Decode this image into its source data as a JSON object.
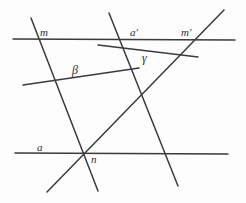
{
  "figure": {
    "width": 246,
    "height": 203,
    "background_color": "#fdfdfd",
    "stroke_color": "#3a3a3f",
    "label_color": "#2e2e33"
  },
  "lines": [
    {
      "name": "horizontal-line-upper",
      "role": "upper horizontal transversal",
      "x1": 13,
      "y1": 39,
      "x2": 235,
      "y2": 40
    },
    {
      "name": "horizontal-line-a",
      "role": "lower horizontal line labeled a",
      "x1": 15,
      "y1": 153,
      "x2": 228,
      "y2": 154
    },
    {
      "name": "line-m",
      "role": "steep descending line labeled m",
      "x1": 31,
      "y1": 18,
      "x2": 98,
      "y2": 191
    },
    {
      "name": "line-a-prime",
      "role": "steep descending line labeled a-prime",
      "x1": 109,
      "y1": 13,
      "x2": 178,
      "y2": 186
    },
    {
      "name": "line-m-prime",
      "role": "ascending line labeled m-prime",
      "x1": 47,
      "y1": 192,
      "x2": 224,
      "y2": 10
    },
    {
      "name": "line-beta",
      "role": "shallow ascending segment labeled beta",
      "x1": 23,
      "y1": 85,
      "x2": 139,
      "y2": 68
    },
    {
      "name": "line-gamma",
      "role": "shallow descending segment labeled gamma",
      "x1": 98,
      "y1": 45,
      "x2": 198,
      "y2": 57
    }
  ],
  "labels": [
    {
      "name": "label-m",
      "text": "m",
      "x": 40,
      "y": 27,
      "style": "italic"
    },
    {
      "name": "label-a-prime",
      "text": "a′",
      "x": 130,
      "y": 27,
      "style": "italic"
    },
    {
      "name": "label-m-prime",
      "text": "m′",
      "x": 181,
      "y": 27,
      "style": "italic"
    },
    {
      "name": "label-gamma",
      "text": "γ",
      "x": 142,
      "y": 52,
      "style": "greek"
    },
    {
      "name": "label-beta",
      "text": "β",
      "x": 72,
      "y": 64,
      "style": "greek"
    },
    {
      "name": "label-a",
      "text": "a",
      "x": 37,
      "y": 142,
      "style": "italic"
    },
    {
      "name": "label-n",
      "text": "n",
      "x": 91,
      "y": 154,
      "style": "italic"
    }
  ]
}
